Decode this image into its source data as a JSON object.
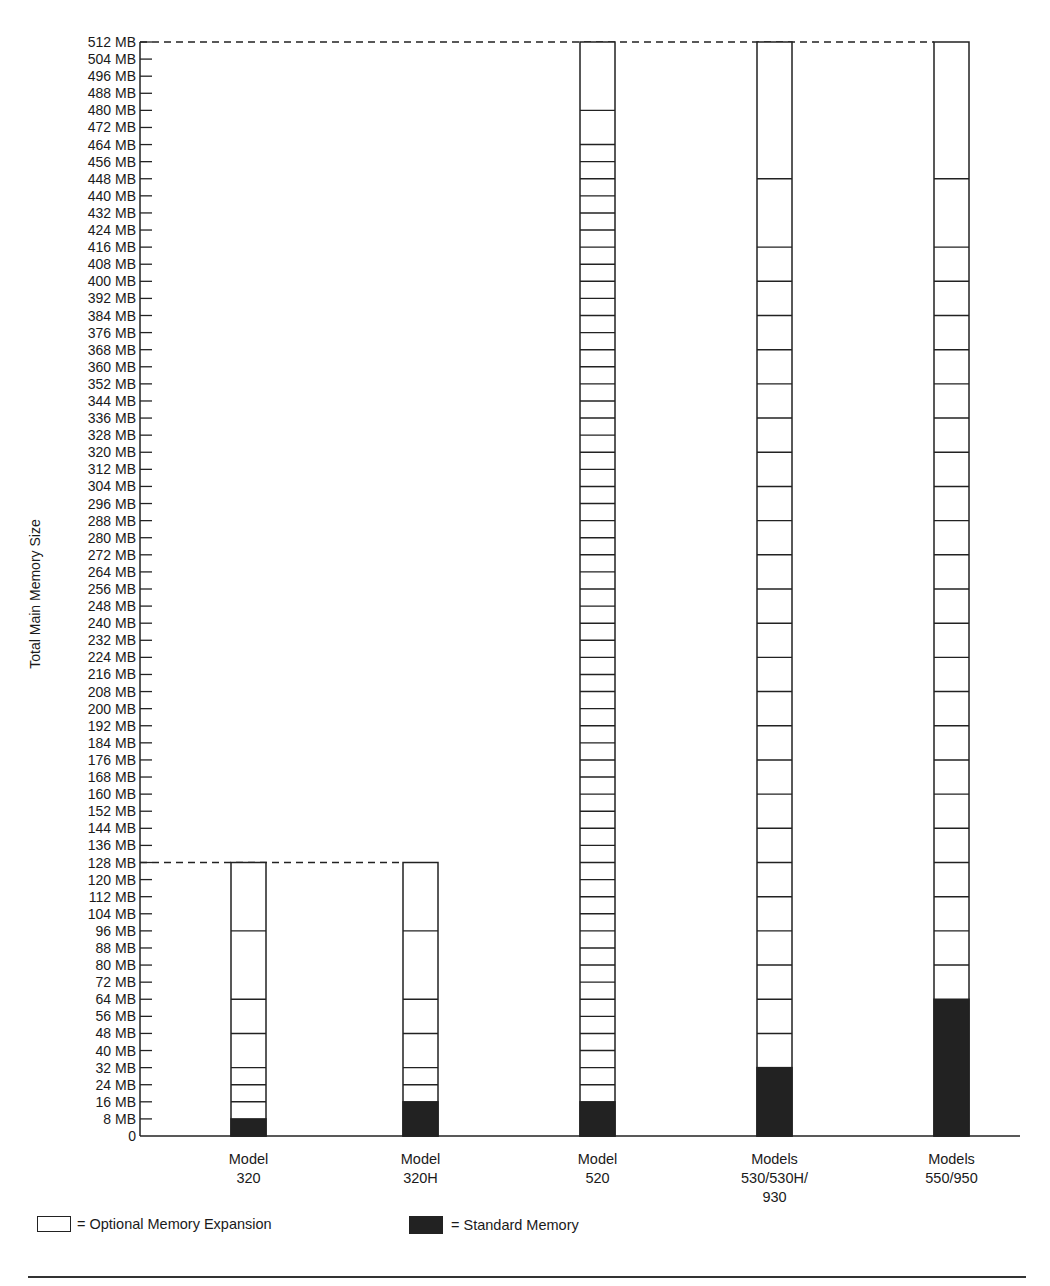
{
  "chart_data": {
    "type": "bar",
    "title": "",
    "ylabel": "Total Main Memory Size",
    "xlabel": "",
    "ylim": [
      0,
      512
    ],
    "y_tick_step": 8,
    "y_ticks": [
      "0",
      "8 MB",
      "16 MB",
      "24 MB",
      "32 MB",
      "40 MB",
      "48 MB",
      "56 MB",
      "64 MB",
      "72 MB",
      "80 MB",
      "88 MB",
      "96 MB",
      "104 MB",
      "112 MB",
      "120 MB",
      "128 MB",
      "136 MB",
      "144 MB",
      "152 MB",
      "160 MB",
      "168 MB",
      "176 MB",
      "184 MB",
      "192 MB",
      "200 MB",
      "208 MB",
      "216 MB",
      "224 MB",
      "232 MB",
      "240 MB",
      "248 MB",
      "256 MB",
      "264 MB",
      "272 MB",
      "280 MB",
      "288 MB",
      "296 MB",
      "304 MB",
      "312 MB",
      "320 MB",
      "328 MB",
      "336 MB",
      "344 MB",
      "352 MB",
      "360 MB",
      "368 MB",
      "376 MB",
      "384 MB",
      "392 MB",
      "400 MB",
      "408 MB",
      "416 MB",
      "424 MB",
      "432 MB",
      "440 MB",
      "448 MB",
      "456 MB",
      "464 MB",
      "472 MB",
      "480 MB",
      "488 MB",
      "496 MB",
      "504 MB",
      "512 MB"
    ],
    "categories": [
      "Model 320",
      "Model 320H",
      "Model 520",
      "Models 530/530H/930",
      "Models 550/950"
    ],
    "category_labels": [
      [
        "Model",
        "320"
      ],
      [
        "Model",
        "320H"
      ],
      [
        "Model",
        "520"
      ],
      [
        "Models",
        "530/530H/",
        "930"
      ],
      [
        "Models",
        "550/950"
      ]
    ],
    "series": [
      {
        "name": "Standard Memory",
        "values": [
          8,
          16,
          16,
          32,
          64
        ],
        "color": "#222222"
      },
      {
        "name": "Optional Memory Expansion",
        "values": [
          120,
          112,
          496,
          480,
          448
        ],
        "color": "#ffffff"
      }
    ],
    "max_memory": [
      128,
      128,
      512,
      512,
      512
    ],
    "expansion_increments": [
      [
        16,
        24,
        32,
        48,
        64,
        96,
        128
      ],
      [
        24,
        32,
        48,
        64,
        96,
        128
      ],
      [
        24,
        32,
        40,
        48,
        56,
        64,
        72,
        80,
        88,
        96,
        104,
        112,
        120,
        128,
        136,
        144,
        152,
        160,
        168,
        176,
        184,
        192,
        200,
        208,
        216,
        224,
        232,
        240,
        248,
        256,
        264,
        272,
        280,
        288,
        296,
        304,
        312,
        320,
        328,
        336,
        344,
        352,
        360,
        368,
        376,
        384,
        392,
        400,
        408,
        416,
        424,
        432,
        440,
        448,
        456,
        464,
        480,
        512
      ],
      [
        48,
        64,
        80,
        96,
        112,
        128,
        144,
        160,
        176,
        192,
        208,
        224,
        240,
        256,
        272,
        288,
        304,
        320,
        336,
        352,
        368,
        384,
        400,
        416,
        448,
        512
      ],
      [
        80,
        96,
        112,
        128,
        144,
        160,
        176,
        192,
        208,
        224,
        240,
        256,
        272,
        288,
        304,
        320,
        336,
        352,
        368,
        384,
        400,
        416,
        448,
        512
      ]
    ],
    "reference_lines": [
      {
        "value": 128,
        "style": "dashed",
        "from": "axis",
        "to": "Model 320H"
      },
      {
        "value": 512,
        "style": "dashed",
        "from": "axis",
        "to": "Models 550/950"
      }
    ],
    "grid": false,
    "legend_position": "bottom-left"
  },
  "legend": {
    "optional_label": "= Optional Memory Expansion",
    "standard_label": "= Standard Memory"
  },
  "colors": {
    "ink": "#222222",
    "background": "#ffffff"
  }
}
